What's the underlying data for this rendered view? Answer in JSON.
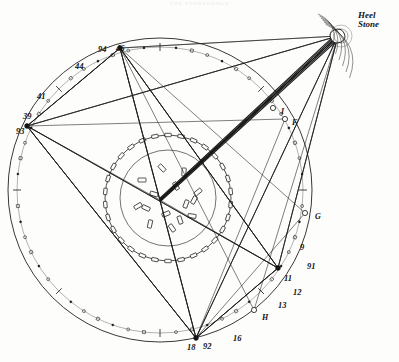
{
  "figure": {
    "page_header": "THE STONEHENGE",
    "background_color": "#fdfdfc",
    "ink_color": "#141414"
  },
  "annotations": {
    "heel_stone": {
      "line1": "Heel",
      "line2": "Stone"
    },
    "station_numbers": [
      {
        "id": "94",
        "label": "94",
        "x": 98,
        "y": 45
      },
      {
        "id": "46",
        "label": "46",
        "x": 116,
        "y": 44
      },
      {
        "id": "44",
        "label": "44",
        "x": 75,
        "y": 62
      },
      {
        "id": "41",
        "label": "41",
        "x": 37,
        "y": 92
      },
      {
        "id": "39",
        "label": "39",
        "x": 23,
        "y": 112
      },
      {
        "id": "93",
        "label": "93",
        "x": 16,
        "y": 127
      },
      {
        "id": "9",
        "label": "9",
        "x": 300,
        "y": 243
      },
      {
        "id": "91",
        "label": "91",
        "x": 307,
        "y": 262
      },
      {
        "id": "11",
        "label": "11",
        "x": 284,
        "y": 274
      },
      {
        "id": "12",
        "label": "12",
        "x": 293,
        "y": 288
      },
      {
        "id": "13",
        "label": "13",
        "x": 278,
        "y": 301
      },
      {
        "id": "16",
        "label": "16",
        "x": 233,
        "y": 334
      },
      {
        "id": "18",
        "label": "18",
        "x": 187,
        "y": 343
      },
      {
        "id": "92",
        "label": "92",
        "x": 203,
        "y": 342
      }
    ],
    "letters": [
      {
        "id": "I",
        "label": "I",
        "x": 281,
        "y": 108
      },
      {
        "id": "F",
        "label": "F",
        "x": 292,
        "y": 119
      },
      {
        "id": "G",
        "label": "G",
        "x": 315,
        "y": 213
      },
      {
        "id": "H",
        "label": "H",
        "x": 262,
        "y": 314
      }
    ]
  },
  "chart_data": {
    "type": "scatter",
    "xlabel": "",
    "ylabel": "",
    "grid": false,
    "legend": "none",
    "xlim": [
      0,
      399
    ],
    "ylim": [
      0,
      362
    ],
    "geometry": {
      "outer_bank_circle": {
        "cx": 160,
        "cy": 190,
        "r": 152
      },
      "aubrey_hole_circle": {
        "cx": 160,
        "cy": 190,
        "r": 143
      },
      "sarsen_circle": {
        "cx": 168,
        "cy": 198,
        "r": 63
      },
      "inner_circle": {
        "cx": 168,
        "cy": 198,
        "r": 48
      },
      "centre_point": {
        "x": 160,
        "y": 200
      },
      "heel_stone": {
        "x": 338,
        "y": 36
      }
    },
    "nodes": [
      {
        "id": "46",
        "x": 120,
        "y": 48
      },
      {
        "id": "93",
        "x": 27,
        "y": 126
      },
      {
        "id": "11",
        "x": 278,
        "y": 268
      },
      {
        "id": "18",
        "x": 196,
        "y": 338
      },
      {
        "id": "F",
        "x": 285,
        "y": 119
      },
      {
        "id": "G",
        "x": 305,
        "y": 213
      },
      {
        "id": "H",
        "x": 254,
        "y": 310
      },
      {
        "id": "heel",
        "x": 338,
        "y": 36
      },
      {
        "id": "centre",
        "x": 160,
        "y": 200
      }
    ],
    "sight_lines": [
      {
        "from": "centre",
        "to": "heel",
        "weight": "heavy",
        "note": "midsummer sunrise axis"
      },
      {
        "from": "93",
        "to": "heel",
        "weight": "light"
      },
      {
        "from": "46",
        "to": "11",
        "weight": "light"
      },
      {
        "from": "93",
        "to": "11",
        "weight": "light"
      },
      {
        "from": "93",
        "to": "18",
        "weight": "light"
      },
      {
        "from": "46",
        "to": "18",
        "weight": "light"
      },
      {
        "from": "46",
        "to": "93",
        "weight": "light"
      },
      {
        "from": "11",
        "to": "18",
        "weight": "light"
      },
      {
        "from": "heel",
        "to": "18",
        "weight": "light"
      },
      {
        "from": "heel",
        "to": "11",
        "weight": "light"
      },
      {
        "from": "heel",
        "to": "centre",
        "weight": "light"
      }
    ],
    "aubrey_hole_count": 56,
    "sarsen_stone_count": 30
  }
}
